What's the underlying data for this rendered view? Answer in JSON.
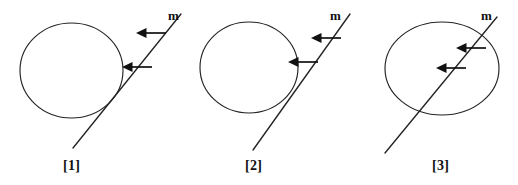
{
  "page": {
    "background_color": "#ffffff",
    "ink_color": "#232323",
    "arrow_color": "#111111",
    "width": 518,
    "height": 185
  },
  "figures": [
    {
      "id": "figure-1",
      "caption": "[1]",
      "line_label": "m",
      "relation": "line does not meet the circle",
      "caption_x": 63,
      "caption_y": 170,
      "label_x": 168,
      "label_y": 20,
      "circle": {
        "cx": 71.5,
        "cy": 70.5,
        "rx": 51.5,
        "ry": 47.5
      },
      "line": {
        "x1": 73,
        "y1": 148,
        "x2": 181,
        "y2": 14
      },
      "arrows": [
        {
          "name": "upper-arrow",
          "tail_x": 166,
          "tail_y": 33,
          "tip_x": 136,
          "tip_y": 33
        },
        {
          "name": "lower-arrow",
          "tail_x": 152,
          "tail_y": 67,
          "tip_x": 122,
          "tip_y": 67
        }
      ]
    },
    {
      "id": "figure-2",
      "caption": "[2]",
      "line_label": "m",
      "relation": "line is tangent to the circle at one point",
      "caption_x": 245,
      "caption_y": 170,
      "label_x": 330,
      "label_y": 20,
      "circle": {
        "cx": 249,
        "cy": 67.5,
        "rx": 49,
        "ry": 45.5
      },
      "line": {
        "x1": 253,
        "y1": 150,
        "x2": 350,
        "y2": 14
      },
      "arrows": [
        {
          "name": "upper-arrow",
          "tail_x": 341,
          "tail_y": 38,
          "tip_x": 311,
          "tip_y": 38
        },
        {
          "name": "lower-arrow",
          "tail_x": 318,
          "tail_y": 62,
          "tip_x": 288,
          "tip_y": 62
        }
      ]
    },
    {
      "id": "figure-3",
      "caption": "[3]",
      "line_label": "m",
      "relation": "line is a secant cutting the circle at two points",
      "caption_x": 432,
      "caption_y": 170,
      "label_x": 481,
      "label_y": 20,
      "circle": {
        "cx": 442,
        "cy": 68.5,
        "rx": 57,
        "ry": 46.5
      },
      "line": {
        "x1": 385,
        "y1": 153,
        "x2": 497,
        "y2": 17
      },
      "arrows": [
        {
          "name": "upper-arrow",
          "tail_x": 486,
          "tail_y": 48,
          "tip_x": 456,
          "tip_y": 48
        },
        {
          "name": "lower-arrow",
          "tail_x": 466,
          "tail_y": 68,
          "tip_x": 436,
          "tip_y": 68
        }
      ]
    }
  ]
}
